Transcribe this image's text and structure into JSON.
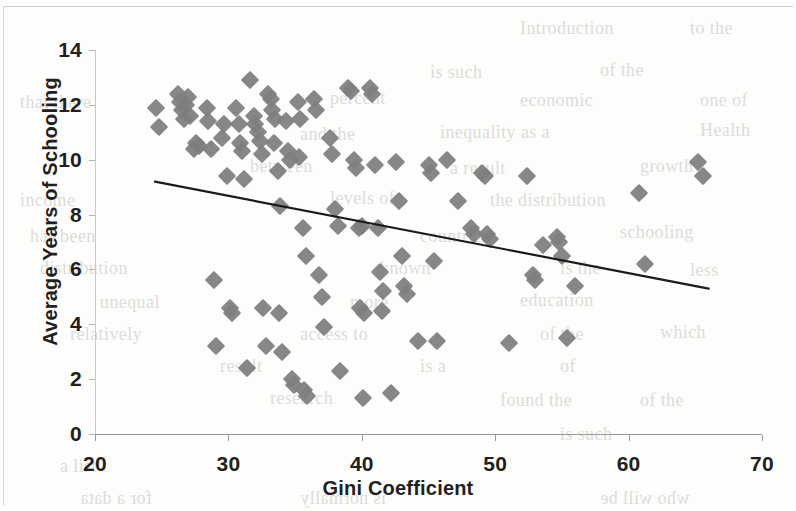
{
  "figure": {
    "background_color": "#fdfdfc",
    "marker_color": "#7e7e7e",
    "trendline_color": "#1a1a1a",
    "axis_color": "#9a9a98",
    "text_color": "#231f20"
  },
  "axes": {
    "x_title": "Gini Coefficient",
    "y_title": "Average Years of Schooling",
    "x_ticks": [
      "20",
      "30",
      "40",
      "50",
      "60",
      "70"
    ],
    "y_ticks": [
      "0",
      "2",
      "4",
      "6",
      "8",
      "10",
      "12",
      "14"
    ]
  },
  "ghost_text": [
    {
      "text": "Introduction",
      "x": 520,
      "y": 18,
      "size": 18,
      "flip": false
    },
    {
      "text": "to the",
      "x": 690,
      "y": 18,
      "size": 18,
      "flip": false
    },
    {
      "text": "is such",
      "x": 430,
      "y": 62,
      "size": 18,
      "flip": false
    },
    {
      "text": "of the",
      "x": 600,
      "y": 60,
      "size": 18,
      "flip": false
    },
    {
      "text": "that there",
      "x": 20,
      "y": 92,
      "size": 18,
      "flip": false
    },
    {
      "text": "percent",
      "x": 330,
      "y": 88,
      "size": 18,
      "flip": false
    },
    {
      "text": "economic",
      "x": 520,
      "y": 90,
      "size": 18,
      "flip": false
    },
    {
      "text": "one of",
      "x": 700,
      "y": 90,
      "size": 18,
      "flip": false
    },
    {
      "text": "and the",
      "x": 300,
      "y": 124,
      "size": 18,
      "flip": false
    },
    {
      "text": "inequality as a",
      "x": 440,
      "y": 122,
      "size": 18,
      "flip": false
    },
    {
      "text": "Health",
      "x": 700,
      "y": 120,
      "size": 18,
      "flip": false
    },
    {
      "text": "between",
      "x": 250,
      "y": 156,
      "size": 18,
      "flip": false
    },
    {
      "text": "a result",
      "x": 450,
      "y": 158,
      "size": 18,
      "flip": false
    },
    {
      "text": "growth",
      "x": 640,
      "y": 156,
      "size": 18,
      "flip": false
    },
    {
      "text": "income",
      "x": 20,
      "y": 190,
      "size": 18,
      "flip": false
    },
    {
      "text": "levels of",
      "x": 330,
      "y": 188,
      "size": 18,
      "flip": false
    },
    {
      "text": "the distribution",
      "x": 490,
      "y": 190,
      "size": 18,
      "flip": false
    },
    {
      "text": "has been",
      "x": 30,
      "y": 226,
      "size": 18,
      "flip": false
    },
    {
      "text": "countries",
      "x": 420,
      "y": 226,
      "size": 18,
      "flip": false
    },
    {
      "text": "schooling",
      "x": 620,
      "y": 222,
      "size": 18,
      "flip": false
    },
    {
      "text": "distribution",
      "x": 40,
      "y": 258,
      "size": 18,
      "flip": false
    },
    {
      "text": "known",
      "x": 380,
      "y": 258,
      "size": 18,
      "flip": false
    },
    {
      "text": "is the",
      "x": 560,
      "y": 258,
      "size": 18,
      "flip": false
    },
    {
      "text": "less",
      "x": 690,
      "y": 260,
      "size": 18,
      "flip": false
    },
    {
      "text": "unequal",
      "x": 100,
      "y": 292,
      "size": 18,
      "flip": false
    },
    {
      "text": "more",
      "x": 350,
      "y": 292,
      "size": 18,
      "flip": false
    },
    {
      "text": "education",
      "x": 520,
      "y": 290,
      "size": 18,
      "flip": false
    },
    {
      "text": "relatively",
      "x": 70,
      "y": 324,
      "size": 18,
      "flip": false
    },
    {
      "text": "access to",
      "x": 300,
      "y": 324,
      "size": 18,
      "flip": false
    },
    {
      "text": "of the",
      "x": 540,
      "y": 324,
      "size": 18,
      "flip": false
    },
    {
      "text": "which",
      "x": 660,
      "y": 322,
      "size": 18,
      "flip": false
    },
    {
      "text": "result",
      "x": 220,
      "y": 356,
      "size": 18,
      "flip": false
    },
    {
      "text": "is a",
      "x": 420,
      "y": 356,
      "size": 18,
      "flip": false
    },
    {
      "text": "of",
      "x": 560,
      "y": 356,
      "size": 18,
      "flip": false
    },
    {
      "text": "research",
      "x": 270,
      "y": 388,
      "size": 18,
      "flip": false
    },
    {
      "text": "found the",
      "x": 500,
      "y": 390,
      "size": 18,
      "flip": false
    },
    {
      "text": "of the",
      "x": 640,
      "y": 390,
      "size": 18,
      "flip": false
    },
    {
      "text": "is such",
      "x": 560,
      "y": 424,
      "size": 18,
      "flip": false
    },
    {
      "text": "a list",
      "x": 60,
      "y": 456,
      "size": 18,
      "flip": false
    },
    {
      "text": "for a data",
      "x": 80,
      "y": 488,
      "size": 18,
      "flip": true
    },
    {
      "text": "is normally",
      "x": 300,
      "y": 488,
      "size": 18,
      "flip": true
    },
    {
      "text": "who will be",
      "x": 600,
      "y": 488,
      "size": 18,
      "flip": true
    }
  ],
  "chart_data": {
    "type": "scatter",
    "title": "",
    "xlabel": "Gini Coefficient",
    "ylabel": "Average Years of Schooling",
    "xlim": [
      20,
      70
    ],
    "ylim": [
      0,
      14
    ],
    "xticks": [
      20,
      30,
      40,
      50,
      60,
      70
    ],
    "yticks": [
      0,
      2,
      4,
      6,
      8,
      10,
      12,
      14
    ],
    "grid": false,
    "legend": null,
    "marker": "diamond",
    "marker_color": "#7e7e7e",
    "series": [
      {
        "name": "Countries",
        "points": [
          [
            24.6,
            11.9
          ],
          [
            24.8,
            11.2
          ],
          [
            26.2,
            12.4
          ],
          [
            26.4,
            12.1
          ],
          [
            26.5,
            11.8
          ],
          [
            26.7,
            11.5
          ],
          [
            26.8,
            12.0
          ],
          [
            27.0,
            12.3
          ],
          [
            27.1,
            11.6
          ],
          [
            27.4,
            10.4
          ],
          [
            27.6,
            10.6
          ],
          [
            27.8,
            10.5
          ],
          [
            28.4,
            11.9
          ],
          [
            28.5,
            11.4
          ],
          [
            28.7,
            10.4
          ],
          [
            28.9,
            5.6
          ],
          [
            29.1,
            3.2
          ],
          [
            29.5,
            10.8
          ],
          [
            29.7,
            11.3
          ],
          [
            29.9,
            9.4
          ],
          [
            30.1,
            4.6
          ],
          [
            30.3,
            4.4
          ],
          [
            30.6,
            11.9
          ],
          [
            30.8,
            11.3
          ],
          [
            30.9,
            10.6
          ],
          [
            31.0,
            10.3
          ],
          [
            31.2,
            9.3
          ],
          [
            31.4,
            2.4
          ],
          [
            31.6,
            12.9
          ],
          [
            31.9,
            11.6
          ],
          [
            32.0,
            11.3
          ],
          [
            32.2,
            11.0
          ],
          [
            32.4,
            10.7
          ],
          [
            32.5,
            10.2
          ],
          [
            32.6,
            4.6
          ],
          [
            32.8,
            3.2
          ],
          [
            33.0,
            12.4
          ],
          [
            33.2,
            12.2
          ],
          [
            33.3,
            11.8
          ],
          [
            33.5,
            11.5
          ],
          [
            33.4,
            10.6
          ],
          [
            33.7,
            9.6
          ],
          [
            33.9,
            8.3
          ],
          [
            33.8,
            4.4
          ],
          [
            34.0,
            3.0
          ],
          [
            34.3,
            11.4
          ],
          [
            34.5,
            10.3
          ],
          [
            34.6,
            10.0
          ],
          [
            34.8,
            2.0
          ],
          [
            34.9,
            1.8
          ],
          [
            35.2,
            12.1
          ],
          [
            35.4,
            11.5
          ],
          [
            35.3,
            10.1
          ],
          [
            35.6,
            7.5
          ],
          [
            35.8,
            6.5
          ],
          [
            35.7,
            1.6
          ],
          [
            35.9,
            1.4
          ],
          [
            36.4,
            12.2
          ],
          [
            36.6,
            11.8
          ],
          [
            36.8,
            5.8
          ],
          [
            37.0,
            5.0
          ],
          [
            37.2,
            3.9
          ],
          [
            37.6,
            10.8
          ],
          [
            37.8,
            10.2
          ],
          [
            38.0,
            8.2
          ],
          [
            38.2,
            7.6
          ],
          [
            38.4,
            2.3
          ],
          [
            39.0,
            12.6
          ],
          [
            39.2,
            12.5
          ],
          [
            39.4,
            10.0
          ],
          [
            39.6,
            9.7
          ],
          [
            39.8,
            7.5
          ],
          [
            40.0,
            7.6
          ],
          [
            39.9,
            4.6
          ],
          [
            40.2,
            4.4
          ],
          [
            40.1,
            1.3
          ],
          [
            40.6,
            12.6
          ],
          [
            40.8,
            12.4
          ],
          [
            41.0,
            9.8
          ],
          [
            41.2,
            7.5
          ],
          [
            41.4,
            5.9
          ],
          [
            41.6,
            5.2
          ],
          [
            41.5,
            4.5
          ],
          [
            42.2,
            1.5
          ],
          [
            42.6,
            9.9
          ],
          [
            42.8,
            8.5
          ],
          [
            43.0,
            6.5
          ],
          [
            43.2,
            5.4
          ],
          [
            43.4,
            5.1
          ],
          [
            44.2,
            3.4
          ],
          [
            45.0,
            9.8
          ],
          [
            45.2,
            9.5
          ],
          [
            45.4,
            6.3
          ],
          [
            45.6,
            3.4
          ],
          [
            46.4,
            10.0
          ],
          [
            47.2,
            8.5
          ],
          [
            48.2,
            7.5
          ],
          [
            48.4,
            7.3
          ],
          [
            49.0,
            9.5
          ],
          [
            49.2,
            9.4
          ],
          [
            49.4,
            7.3
          ],
          [
            49.6,
            7.1
          ],
          [
            51.0,
            3.3
          ],
          [
            52.4,
            9.4
          ],
          [
            52.8,
            5.8
          ],
          [
            53.0,
            5.6
          ],
          [
            53.6,
            6.9
          ],
          [
            54.6,
            7.2
          ],
          [
            54.8,
            7.0
          ],
          [
            55.0,
            6.5
          ],
          [
            55.4,
            3.5
          ],
          [
            56.0,
            5.4
          ],
          [
            60.8,
            8.8
          ],
          [
            61.2,
            6.2
          ],
          [
            65.2,
            9.9
          ],
          [
            65.6,
            9.4
          ]
        ]
      }
    ],
    "trendline": {
      "type": "linear",
      "x_start": 24.5,
      "y_start": 9.2,
      "x_end": 66.0,
      "y_end": 5.3,
      "color": "#1a1a1a"
    }
  }
}
